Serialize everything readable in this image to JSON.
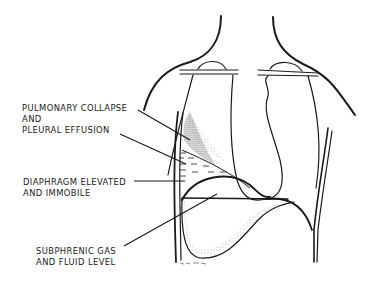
{
  "figure": {
    "type": "medical-illustration",
    "colors": {
      "ink": "#1a1a1a",
      "background": "#ffffff",
      "stipple": "#555555"
    }
  },
  "labels": {
    "pulmonary": {
      "line1": "PULMONARY COLLAPSE",
      "line2": "AND",
      "line3": "PLEURAL EFFUSION"
    },
    "diaphragm": {
      "line1": "DIAPHRAGM ELEVATED",
      "line2": "AND IMMOBILE"
    },
    "subphrenic": {
      "line1": "SUBPHRENIC GAS",
      "line2": "AND FLUID LEVEL"
    }
  }
}
